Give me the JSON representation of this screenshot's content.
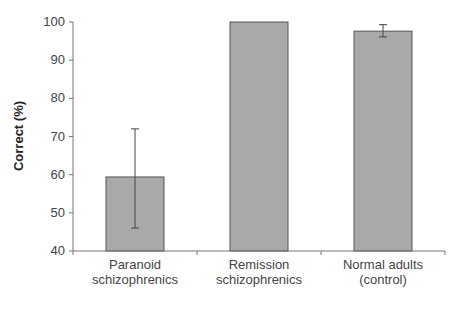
{
  "chart_data": {
    "type": "bar",
    "title": "",
    "xlabel": "",
    "ylabel": "Correct (%)",
    "ylim": [
      40,
      100
    ],
    "yticks": [
      40,
      50,
      60,
      70,
      80,
      90,
      100
    ],
    "grid": false,
    "legend": null,
    "categories": [
      "Paranoid schizophrenics",
      "Remission schizophrenics",
      "Normal adults (control)"
    ],
    "category_lines": [
      [
        "Paranoid",
        "schizophrenics"
      ],
      [
        "Remission",
        "schizophrenics"
      ],
      [
        "Normal adults",
        "(control)"
      ]
    ],
    "series": [
      {
        "name": "Correct (%)",
        "values": [
          59.4,
          100,
          97.6
        ],
        "error_low": [
          46,
          100,
          96.1
        ],
        "error_high": [
          72,
          100,
          99.3
        ],
        "color": "#a9a9a9"
      }
    ]
  }
}
